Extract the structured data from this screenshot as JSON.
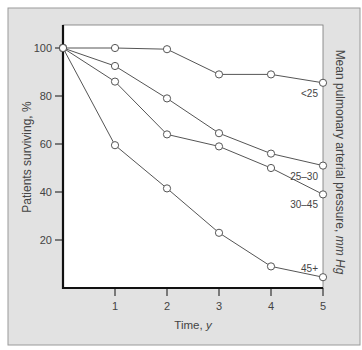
{
  "colors": {
    "frame_bg": "#e2e2e2",
    "frame_border": "#9a9a9a",
    "plot_bg": "#ffffff",
    "axis": "#111111",
    "line": "#555555",
    "marker_fill": "#ffffff",
    "text": "#444444"
  },
  "chart_data": {
    "type": "line",
    "title": "",
    "xlabel": "Time, y",
    "xlabel_main": "Time, ",
    "xlabel_unit": "y",
    "ylabel": "Patients surviving, %",
    "right_label": "Mean pulmonary arterial pressure, mm Hg",
    "right_label_main": "Mean pulmonary arterial pressure, ",
    "right_label_unit": "mm Hg",
    "x": [
      0,
      1,
      2,
      3,
      4,
      5
    ],
    "x_ticks": [
      "1",
      "2",
      "3",
      "4",
      "5"
    ],
    "y_ticks": [
      "20",
      "40",
      "60",
      "80",
      "100"
    ],
    "xlim": [
      0,
      5
    ],
    "ylim": [
      0,
      100
    ],
    "grid": false,
    "legend_position": "inline labels at right end of each series",
    "series": [
      {
        "name": "<25",
        "values": [
          100,
          100,
          99.5,
          89,
          89,
          85.5
        ]
      },
      {
        "name": "25–30",
        "values": [
          100,
          92.5,
          79,
          64.5,
          56,
          51
        ]
      },
      {
        "name": "30–45",
        "values": [
          100,
          86,
          64,
          59,
          50,
          39
        ]
      },
      {
        "name": "45+",
        "values": [
          100,
          59.5,
          41.5,
          23,
          9,
          4.5
        ]
      }
    ]
  }
}
